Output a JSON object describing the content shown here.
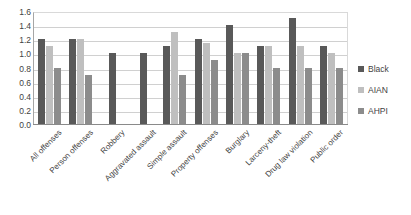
{
  "chart_data": {
    "type": "bar",
    "title": "",
    "xlabel": "",
    "ylabel": "",
    "ylim": [
      0.0,
      1.6
    ],
    "ytick_step": 0.2,
    "grid": true,
    "legend_position": "right",
    "yticks": [
      "1.6",
      "1.4",
      "1.2",
      "1.0",
      "0.8",
      "0.6",
      "0.4",
      "0.2",
      "0.0"
    ],
    "categories": [
      "All offenses",
      "Person offenses",
      "Robbery",
      "Aggravated assault",
      "Simple assault",
      "Property offenses",
      "Burglary",
      "Larceny-theft",
      "Drug law violation",
      "Public order"
    ],
    "series": [
      {
        "name": "Black",
        "color": "#595959",
        "values": [
          1.2,
          1.2,
          1.0,
          1.0,
          1.1,
          1.2,
          1.4,
          1.1,
          1.5,
          1.1
        ]
      },
      {
        "name": "AIAN",
        "color": "#bfbfbf",
        "values": [
          1.1,
          1.2,
          null,
          null,
          1.3,
          1.15,
          1.0,
          1.1,
          1.1,
          1.0
        ]
      },
      {
        "name": "AHPI",
        "color": "#8c8c8c",
        "values": [
          0.8,
          0.7,
          null,
          null,
          0.7,
          0.9,
          1.0,
          0.8,
          0.8,
          0.8
        ]
      }
    ]
  },
  "legend": {
    "items": [
      {
        "label": "Black"
      },
      {
        "label": "AIAN"
      },
      {
        "label": "AHPI"
      }
    ]
  },
  "caption": {
    "text": ""
  }
}
